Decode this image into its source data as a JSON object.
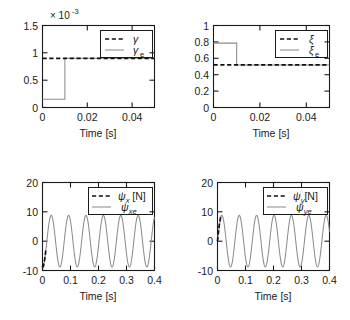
{
  "figure": {
    "panels": [
      {
        "id": "gamma",
        "axis_multiplier": "× 10",
        "axis_multiplier_exponent": "-3",
        "xlabel": "Time [s]",
        "ylabel": "",
        "xticks": [
          "0",
          "0.02",
          "0.04"
        ],
        "xtick_values": [
          0,
          0.02,
          0.04
        ],
        "yticks": [
          "0",
          "0.5",
          "1",
          "1.5"
        ],
        "ytick_values": [
          0,
          0.5,
          1,
          1.5
        ],
        "xlim": [
          0,
          0.05
        ],
        "ylim": [
          0,
          1.5
        ],
        "legend": [
          {
            "label": "γ",
            "sub": "",
            "style": "dashed"
          },
          {
            "label": "γ",
            "sub": "e",
            "style": "solid"
          }
        ]
      },
      {
        "id": "xi",
        "axis_multiplier": "",
        "axis_multiplier_exponent": "",
        "xlabel": "Time [s]",
        "ylabel": "",
        "xticks": [
          "0",
          "0.02",
          "0.04"
        ],
        "xtick_values": [
          0,
          0.02,
          0.04
        ],
        "yticks": [
          "0",
          "0.2",
          "0.4",
          "0.6",
          "0.8",
          "1"
        ],
        "ytick_values": [
          0,
          0.2,
          0.4,
          0.6,
          0.8,
          1
        ],
        "xlim": [
          0,
          0.05
        ],
        "ylim": [
          0,
          1
        ],
        "legend": [
          {
            "label": "ξ",
            "sub": "",
            "style": "dashed"
          },
          {
            "label": "ξ",
            "sub": "e",
            "style": "solid"
          }
        ]
      },
      {
        "id": "psix",
        "axis_multiplier": "",
        "axis_multiplier_exponent": "",
        "xlabel": "Time [s]",
        "ylabel": "",
        "xticks": [
          "0",
          "0.1",
          "0.2",
          "0.3",
          "0.4"
        ],
        "xtick_values": [
          0,
          0.1,
          0.2,
          0.3,
          0.4
        ],
        "yticks": [
          "-10",
          "0",
          "10",
          "20"
        ],
        "ytick_values": [
          -10,
          0,
          10,
          20
        ],
        "xlim": [
          0,
          0.4
        ],
        "ylim": [
          -10,
          20
        ],
        "legend": [
          {
            "label": "ψ",
            "sub": "x",
            "suffix": " [N]",
            "style": "dashed"
          },
          {
            "label": "ψ",
            "sub": "xe",
            "suffix": "",
            "style": "solid"
          }
        ]
      },
      {
        "id": "psiy",
        "axis_multiplier": "",
        "axis_multiplier_exponent": "",
        "xlabel": "Time [s]",
        "ylabel": "",
        "xticks": [
          "0",
          "0.1",
          "0.2",
          "0.3",
          "0.4"
        ],
        "xtick_values": [
          0,
          0.1,
          0.2,
          0.3,
          0.4
        ],
        "yticks": [
          "-10",
          "0",
          "10",
          "20"
        ],
        "ytick_values": [
          -10,
          0,
          10,
          20
        ],
        "xlim": [
          0,
          0.4
        ],
        "ylim": [
          -10,
          20
        ],
        "legend": [
          {
            "label": "ψ",
            "sub": "y",
            "suffix": "[N]",
            "style": "dashed"
          },
          {
            "label": "ψ",
            "sub": "ye",
            "suffix": "",
            "style": "solid"
          }
        ]
      }
    ]
  },
  "chart_data": [
    {
      "type": "line",
      "id": "gamma",
      "title": "",
      "xlabel": "Time [s]",
      "ylabel": "",
      "y_axis_multiplier": 0.001,
      "y_axis_multiplier_text": "× 10^-3",
      "xlim": [
        0,
        0.05
      ],
      "ylim": [
        0,
        1.5
      ],
      "xticks": [
        0,
        0.02,
        0.04
      ],
      "yticks": [
        0,
        0.5,
        1,
        1.5
      ],
      "grid": false,
      "legend_position": "upper right",
      "series": [
        {
          "name": "γ",
          "style": "dashed",
          "color": "#111111",
          "description": "true parameter, constant",
          "x": [
            0,
            0.05
          ],
          "y": [
            0.9,
            0.9
          ]
        },
        {
          "name": "γ_e",
          "style": "solid",
          "color": "#8c8c8c",
          "description": "estimate, steps up to true value at t = 0.01 s",
          "x": [
            0,
            0.0099,
            0.01,
            0.05
          ],
          "y": [
            0.15,
            0.15,
            0.9,
            0.9
          ]
        }
      ]
    },
    {
      "type": "line",
      "id": "xi",
      "title": "",
      "xlabel": "Time [s]",
      "ylabel": "",
      "xlim": [
        0,
        0.05
      ],
      "ylim": [
        0,
        1
      ],
      "xticks": [
        0,
        0.02,
        0.04
      ],
      "yticks": [
        0,
        0.2,
        0.4,
        0.6,
        0.8,
        1
      ],
      "grid": false,
      "legend_position": "upper right",
      "series": [
        {
          "name": "ξ",
          "style": "dashed",
          "color": "#111111",
          "description": "true parameter, constant",
          "x": [
            0,
            0.05
          ],
          "y": [
            0.52,
            0.52
          ]
        },
        {
          "name": "ξ_e",
          "style": "solid",
          "color": "#8c8c8c",
          "description": "estimate, steps down to true value at t = 0.01 s",
          "x": [
            0,
            0.0099,
            0.01,
            0.05
          ],
          "y": [
            0.785,
            0.785,
            0.52,
            0.52
          ]
        }
      ]
    },
    {
      "type": "line",
      "id": "psix",
      "title": "",
      "xlabel": "Time [s]",
      "ylabel": "",
      "xlim": [
        0,
        0.4
      ],
      "ylim": [
        -10,
        20
      ],
      "xticks": [
        0,
        0.1,
        0.2,
        0.3,
        0.4
      ],
      "yticks": [
        -10,
        0,
        10,
        20
      ],
      "grid": false,
      "legend_position": "upper right",
      "series": [
        {
          "name": "ψ_x [N]",
          "style": "dashed",
          "color": "#111111",
          "description": "true signal, visible only as short transient near t = 0",
          "amplitude": 8.8,
          "frequency_hz": 16.1,
          "phase_deg": -90,
          "t_range": [
            0,
            0.012
          ]
        },
        {
          "name": "ψ_xe",
          "style": "solid",
          "color": "#8c8c8c",
          "description": "estimated sinusoidal force, starts at zero rising",
          "amplitude": 8.8,
          "frequency_hz": 16.1,
          "phase_deg": -90,
          "t_range": [
            0,
            0.4
          ]
        }
      ]
    },
    {
      "type": "line",
      "id": "psiy",
      "title": "",
      "xlabel": "Time [s]",
      "ylabel": "",
      "xlim": [
        0,
        0.4
      ],
      "ylim": [
        -10,
        20
      ],
      "xticks": [
        0,
        0.1,
        0.2,
        0.3,
        0.4
      ],
      "yticks": [
        -10,
        0,
        10,
        20
      ],
      "grid": false,
      "legend_position": "upper right",
      "series": [
        {
          "name": "ψ_y [N]",
          "style": "dashed",
          "color": "#111111",
          "description": "true signal, visible only as short transient near t = 0",
          "amplitude": 8.8,
          "frequency_hz": 16.1,
          "phase_deg": 0,
          "t_range": [
            0,
            0.012
          ]
        },
        {
          "name": "ψ_ye",
          "style": "solid",
          "color": "#8c8c8c",
          "description": "estimated sinusoidal force, starts near peak",
          "amplitude": 8.8,
          "frequency_hz": 16.1,
          "phase_deg": 0,
          "t_range": [
            0,
            0.4
          ]
        }
      ]
    }
  ]
}
